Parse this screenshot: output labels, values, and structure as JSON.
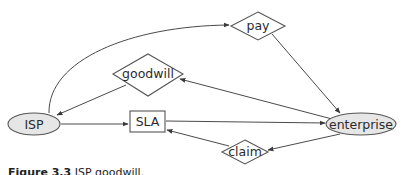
{
  "diagram": {
    "nodes": [
      {
        "id": "isp",
        "label": "ISP",
        "shape": "ellipse",
        "fill": "#e6e6e6"
      },
      {
        "id": "sla",
        "label": "SLA",
        "shape": "rectangle",
        "fill": "#ffffff"
      },
      {
        "id": "enterprise",
        "label": "enterprise",
        "shape": "ellipse",
        "fill": "#e6e6e6"
      },
      {
        "id": "goodwill",
        "label": "goodwill",
        "shape": "diamond",
        "fill": "#ffffff"
      },
      {
        "id": "pay",
        "label": "pay",
        "shape": "diamond",
        "fill": "#ffffff"
      },
      {
        "id": "claim",
        "label": "claim",
        "shape": "diamond",
        "fill": "#ffffff"
      }
    ],
    "edges": [
      {
        "from": "isp",
        "to": "pay"
      },
      {
        "from": "pay",
        "to": "enterprise"
      },
      {
        "from": "enterprise",
        "to": "goodwill"
      },
      {
        "from": "goodwill",
        "to": "isp"
      },
      {
        "from": "isp",
        "to": "sla"
      },
      {
        "from": "sla",
        "to": "enterprise"
      },
      {
        "from": "enterprise",
        "to": "claim"
      },
      {
        "from": "claim",
        "to": "sla"
      }
    ]
  },
  "caption": {
    "prefix": "Figure 3.3",
    "text": "ISP goodwill."
  }
}
